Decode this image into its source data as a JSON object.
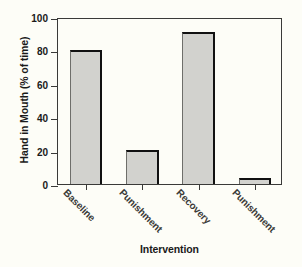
{
  "chart_data": {
    "type": "bar",
    "title": "",
    "categories": [
      "Baseline",
      "Punishment",
      "Recovery",
      "Punishment"
    ],
    "values": [
      80,
      20.5,
      91,
      3.5
    ],
    "xlabel": "Intervention",
    "ylabel": "Hand in Mouth (% of time)",
    "ylim": [
      0,
      100
    ],
    "yticks": [
      0,
      20,
      40,
      60,
      80,
      100
    ],
    "ytick_labels": [
      "0",
      "20",
      "40",
      "60",
      "80",
      "100"
    ],
    "grid": false,
    "legend": null,
    "bar_fill_color": "#d2d2ce",
    "bar_edge_color": "#111111",
    "axis_color": "#3a3a38",
    "background_color": "#fdfdf7",
    "xtick_label_rotation": 45
  }
}
